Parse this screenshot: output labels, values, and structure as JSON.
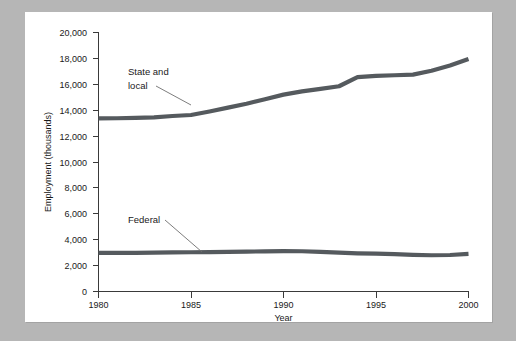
{
  "figure": {
    "background_color": "#b6b6b6",
    "panel_color": "#ffffff"
  },
  "chart_data": {
    "type": "line",
    "title": "",
    "xlabel": "Year",
    "ylabel": "Employment (thousands)",
    "xlim": [
      1980,
      2000
    ],
    "ylim": [
      0,
      20000
    ],
    "xticks": [
      "1980",
      "1985",
      "1990",
      "1995",
      "2000"
    ],
    "yticks": [
      "0",
      "2,000",
      "4,000",
      "6,000",
      "8,000",
      "10,000",
      "12,000",
      "14,000",
      "16,000",
      "18,000",
      "20,000"
    ],
    "grid": false,
    "legend_position": "inline-annotations",
    "line_color": "#555a5e",
    "x": [
      1980,
      1981,
      1982,
      1983,
      1984,
      1985,
      1986,
      1987,
      1988,
      1989,
      1990,
      1991,
      1992,
      1993,
      1994,
      1995,
      1996,
      1997,
      1998,
      1999,
      2000
    ],
    "series": [
      {
        "name": "State and local",
        "annotation": "State and local",
        "values": [
          13370,
          13380,
          13400,
          13450,
          13550,
          13630,
          13900,
          14200,
          14500,
          14850,
          15200,
          15450,
          15650,
          15850,
          16550,
          16650,
          16700,
          16750,
          17050,
          17450,
          17950
        ]
      },
      {
        "name": "Federal",
        "annotation": "Federal",
        "values": [
          2990,
          2990,
          2990,
          3000,
          3020,
          3030,
          3040,
          3060,
          3080,
          3100,
          3120,
          3110,
          3060,
          3000,
          2950,
          2920,
          2880,
          2830,
          2800,
          2820,
          2900
        ]
      }
    ],
    "annotations": [
      {
        "text_line1": "State and",
        "text_line2": "local",
        "series": "State and local"
      },
      {
        "text_line1": "Federal",
        "text_line2": "",
        "series": "Federal"
      }
    ]
  }
}
